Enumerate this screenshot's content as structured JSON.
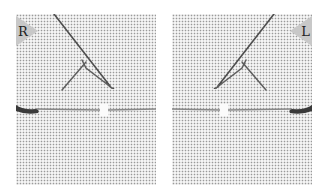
{
  "image": {
    "description": "Two fabric swatches showing a needlework stitch worked in mirror image for right- and left-handed stitchers",
    "background_color": "#ffffff",
    "fabric_color": "#f4f4f4",
    "thread_color": "#5e5e5e",
    "needle_color": "#3a3a3a",
    "label_tab_color": "#c8c8c8"
  },
  "panels": [
    {
      "id": "right-handed",
      "label": "R",
      "label_position": "top-left"
    },
    {
      "id": "left-handed",
      "label": "L",
      "label_position": "top-right"
    }
  ]
}
